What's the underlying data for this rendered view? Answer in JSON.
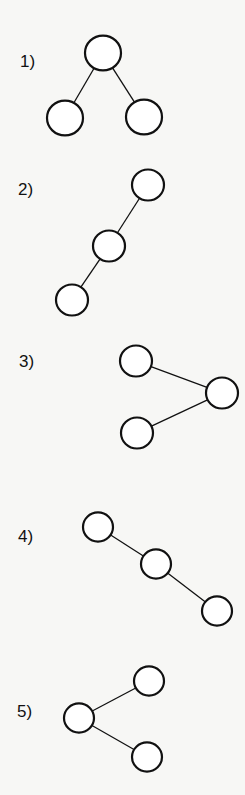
{
  "diagrams": [
    {
      "label": "1)",
      "label_pos": [
        20,
        53
      ],
      "node_radius": 18,
      "nodes": [
        [
          103,
          53
        ],
        [
          65,
          118
        ],
        [
          144,
          117
        ]
      ],
      "edges": [
        [
          0,
          1
        ],
        [
          0,
          2
        ]
      ]
    },
    {
      "label": "2)",
      "label_pos": [
        18,
        181
      ],
      "node_radius": 16,
      "nodes": [
        [
          148,
          185
        ],
        [
          109,
          246
        ],
        [
          72,
          300
        ]
      ],
      "edges": [
        [
          0,
          1
        ],
        [
          1,
          2
        ]
      ]
    },
    {
      "label": "3)",
      "label_pos": [
        19,
        353
      ],
      "node_radius": 16,
      "nodes": [
        [
          136,
          361
        ],
        [
          222,
          393
        ],
        [
          137,
          433
        ]
      ],
      "edges": [
        [
          0,
          1
        ],
        [
          2,
          1
        ]
      ]
    },
    {
      "label": "4)",
      "label_pos": [
        18,
        528
      ],
      "node_radius": 15,
      "nodes": [
        [
          98,
          527
        ],
        [
          156,
          564
        ],
        [
          217,
          611
        ]
      ],
      "edges": [
        [
          0,
          1
        ],
        [
          1,
          2
        ]
      ]
    },
    {
      "label": "5)",
      "label_pos": [
        17,
        703
      ],
      "node_radius": 15,
      "nodes": [
        [
          79,
          718
        ],
        [
          149,
          681
        ],
        [
          147,
          757
        ]
      ],
      "edges": [
        [
          0,
          1
        ],
        [
          0,
          2
        ]
      ]
    }
  ],
  "style": {
    "stroke": "#111111",
    "node_stroke_width": 2.2,
    "edge_stroke_width": 1.3,
    "node_fill": "#ffffff"
  }
}
